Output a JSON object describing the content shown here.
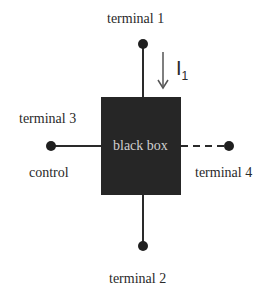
{
  "diagram": {
    "box": {
      "label": "black box",
      "fill": "#262626"
    },
    "terminals": [
      {
        "id": "terminal_1",
        "label": "terminal 1",
        "position": "top",
        "line": "solid"
      },
      {
        "id": "terminal_2",
        "label": "terminal 2",
        "position": "bottom",
        "line": "solid"
      },
      {
        "id": "terminal_3",
        "label": "terminal 3",
        "sublabel": "control",
        "position": "left",
        "line": "solid"
      },
      {
        "id": "terminal_4",
        "label": "terminal 4",
        "position": "right",
        "line": "dashed"
      }
    ],
    "current": {
      "symbol": "I",
      "subscript": "1",
      "direction": "down",
      "terminal": "terminal 1"
    },
    "colors": {
      "line": "#2a2a2a",
      "box": "#262626",
      "box_text": "#cfcfcf",
      "background": "#ffffff"
    }
  }
}
